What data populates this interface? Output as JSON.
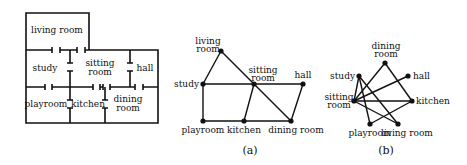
{
  "floor_plan": {
    "rooms": [
      {
        "id": "living",
        "label": "living room",
        "x": 57,
        "y": 33
      },
      {
        "id": "study",
        "label": "study",
        "x": 45,
        "y": 71
      },
      {
        "id": "sitting1",
        "label": "sitting",
        "x": 100,
        "y": 66
      },
      {
        "id": "sitting2",
        "label": "room",
        "x": 100,
        "y": 75
      },
      {
        "id": "hall",
        "label": "hall",
        "x": 145,
        "y": 71
      },
      {
        "id": "playroom",
        "label": "playroom",
        "x": 46,
        "y": 107
      },
      {
        "id": "kitchen",
        "label": "kitchen",
        "x": 88,
        "y": 107
      },
      {
        "id": "dining1",
        "label": "dining",
        "x": 128,
        "y": 102
      },
      {
        "id": "dining2",
        "label": "room",
        "x": 128,
        "y": 111
      }
    ]
  },
  "graph_a": {
    "caption": "(a)",
    "nodes": [
      {
        "id": "living",
        "label": "living",
        "label2": "room",
        "x": 221,
        "y": 51,
        "lx": 208,
        "ly": 44,
        "anchor": "middle"
      },
      {
        "id": "study",
        "label": "study",
        "x": 203,
        "y": 84,
        "lx": 199,
        "ly": 87,
        "anchor": "end"
      },
      {
        "id": "sitting",
        "label": "sitting",
        "label2": "room",
        "x": 254,
        "y": 84,
        "lx": 263,
        "ly": 73,
        "anchor": "middle"
      },
      {
        "id": "hall",
        "label": "hall",
        "x": 303,
        "y": 84,
        "lx": 303,
        "ly": 78,
        "anchor": "middle"
      },
      {
        "id": "playroom",
        "label": "playroom",
        "x": 203,
        "y": 121,
        "lx": 203,
        "ly": 133,
        "anchor": "middle"
      },
      {
        "id": "kitchen",
        "label": "kitchen",
        "x": 244,
        "y": 121,
        "lx": 244,
        "ly": 133,
        "anchor": "middle"
      },
      {
        "id": "dining",
        "label": "dining room",
        "x": 291,
        "y": 121,
        "lx": 296,
        "ly": 133,
        "anchor": "middle"
      }
    ],
    "edges": [
      [
        "living",
        "study"
      ],
      [
        "living",
        "sitting"
      ],
      [
        "sitting",
        "dining"
      ],
      [
        "study",
        "sitting"
      ],
      [
        "sitting",
        "hall"
      ],
      [
        "study",
        "playroom"
      ],
      [
        "playroom",
        "kitchen"
      ],
      [
        "kitchen",
        "dining"
      ],
      [
        "sitting",
        "kitchen"
      ],
      [
        "hall",
        "dining"
      ]
    ]
  },
  "graph_b": {
    "caption": "(b)",
    "nodes": [
      {
        "id": "dining",
        "label": "dining",
        "label2": "room",
        "x": 385,
        "y": 63,
        "lx": 386,
        "ly": 49,
        "anchor": "middle"
      },
      {
        "id": "hall",
        "label": "hall",
        "x": 408,
        "y": 76,
        "lx": 413,
        "ly": 79,
        "anchor": "start"
      },
      {
        "id": "study",
        "label": "study",
        "x": 359,
        "y": 76,
        "lx": 355,
        "ly": 79,
        "anchor": "end"
      },
      {
        "id": "sitting",
        "label": "sitting",
        "label2": "room",
        "x": 354,
        "y": 101,
        "lx": 339,
        "ly": 100,
        "anchor": "middle"
      },
      {
        "id": "kitchen",
        "label": "kitchen",
        "x": 412,
        "y": 101,
        "lx": 416,
        "ly": 104,
        "anchor": "start"
      },
      {
        "id": "playroom",
        "label": "playroom",
        "x": 370,
        "y": 124,
        "lx": 370,
        "ly": 136,
        "anchor": "middle"
      },
      {
        "id": "living",
        "label": "living room",
        "x": 398,
        "y": 124,
        "lx": 407,
        "ly": 136,
        "anchor": "middle"
      }
    ],
    "edges": [
      [
        "study",
        "sitting"
      ],
      [
        "study",
        "playroom"
      ],
      [
        "study",
        "living"
      ],
      [
        "dining",
        "sitting"
      ],
      [
        "dining",
        "kitchen"
      ],
      [
        "hall",
        "sitting"
      ],
      [
        "sitting",
        "kitchen"
      ],
      [
        "sitting",
        "living"
      ],
      [
        "playroom",
        "kitchen"
      ]
    ]
  }
}
